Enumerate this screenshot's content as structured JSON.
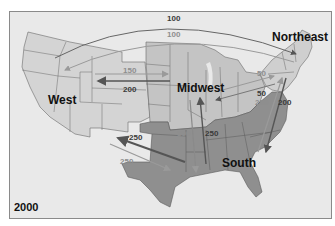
{
  "map": {
    "year": "2000",
    "colors": {
      "background": "#e9e9e9",
      "west": "#d4d4d4",
      "midwest": "#c4c4c4",
      "northeast": "#cfcfcf",
      "south": "#8f8f8f",
      "state_border": "#6a6a6a",
      "flow_dark": "#555555",
      "flow_light": "#9a9a9a"
    },
    "regions": [
      {
        "id": "west",
        "label": "West"
      },
      {
        "id": "midwest",
        "label": "Midwest"
      },
      {
        "id": "northeast",
        "label": "Northeast"
      },
      {
        "id": "south",
        "label": "South"
      }
    ],
    "flows": [
      {
        "from": "West",
        "to": "Northeast",
        "value": "100",
        "shade": "dark"
      },
      {
        "from": "Northeast",
        "to": "West",
        "value": "100",
        "shade": "light"
      },
      {
        "from": "West",
        "to": "Midwest",
        "value": "150",
        "shade": "light"
      },
      {
        "from": "Midwest",
        "to": "West",
        "value": "200",
        "shade": "dark"
      },
      {
        "from": "Midwest",
        "to": "Northeast",
        "value": "50",
        "shade": "light"
      },
      {
        "from": "Northeast",
        "to": "Midwest",
        "value": "50",
        "shade": "dark"
      },
      {
        "from": "South",
        "to": "Northeast",
        "value": "250",
        "shade": "light"
      },
      {
        "from": "Northeast",
        "to": "South",
        "value": "200",
        "shade": "dark"
      },
      {
        "from": "Midwest",
        "to": "South",
        "value": "300",
        "shade": "light"
      },
      {
        "from": "South",
        "to": "Midwest",
        "value": "250",
        "shade": "dark"
      },
      {
        "from": "South",
        "to": "West",
        "value": "250",
        "shade": "dark"
      },
      {
        "from": "West",
        "to": "South",
        "value": "250",
        "shade": "light"
      }
    ]
  }
}
